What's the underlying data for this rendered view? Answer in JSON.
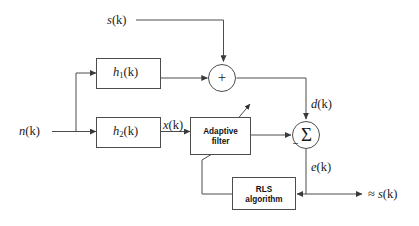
{
  "diagram": {
    "type": "signal-flow-block-diagram",
    "background_color": "#ffffff",
    "line_color": "#4d4d4d",
    "text_color": "#1a1a1a",
    "signals": {
      "source": "s(k)",
      "noise": "n(k)",
      "filter_input": "x(k)",
      "desired": "d(k)",
      "error": "e(k)",
      "output": "≈ s(k)"
    },
    "signal_parts": {
      "s_var": "s",
      "n_var": "n",
      "x_var": "x",
      "d_var": "d",
      "e_var": "e",
      "arg": "(k)",
      "approx": "≈"
    },
    "blocks": [
      {
        "id": "h1",
        "var": "h",
        "subscript": "1",
        "arg": "(k)",
        "label": "h1(k)",
        "kind": "transfer-function"
      },
      {
        "id": "h2",
        "var": "h",
        "subscript": "2",
        "arg": "(k)",
        "label": "h2(k)",
        "kind": "transfer-function"
      },
      {
        "id": "adaptive-filter",
        "line1": "Adaptive",
        "line2": "filter",
        "label": "Adaptive filter",
        "kind": "processing-block"
      },
      {
        "id": "rls-algorithm",
        "line1": "RLS",
        "line2": "algorithm",
        "label": "RLS algorithm",
        "kind": "processing-block"
      }
    ],
    "operators": [
      {
        "id": "adder",
        "glyph": "+",
        "name": "summing-junction-plus"
      },
      {
        "id": "subtractor",
        "glyph": "Σ",
        "name": "summing-junction-sigma",
        "negative_input_mark": "–"
      }
    ]
  }
}
